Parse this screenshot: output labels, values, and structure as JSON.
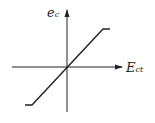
{
  "diagram": {
    "type": "saturation-characteristic",
    "y_axis": {
      "label": "e",
      "subscript": "c"
    },
    "x_axis": {
      "label": "E",
      "subscript": "ct"
    },
    "curve": {
      "description": "linear through origin with saturation at both ends",
      "points": [
        [
          25,
          105
        ],
        [
          32,
          105
        ],
        [
          103,
          29
        ],
        [
          110,
          29
        ]
      ]
    },
    "colors": {
      "line": "#222222",
      "background": "#ffffff"
    }
  }
}
